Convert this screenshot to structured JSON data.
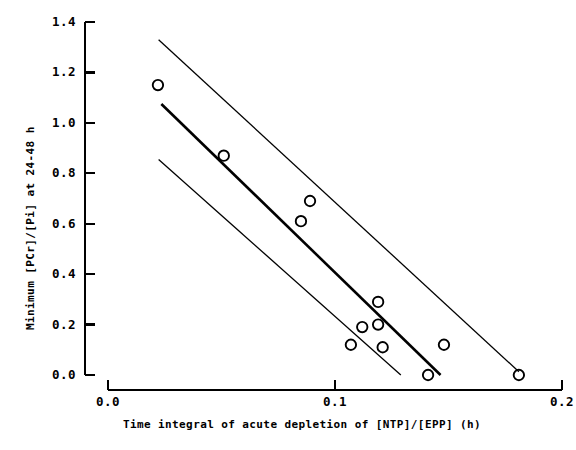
{
  "chart_data": {
    "type": "scatter",
    "title": "",
    "xlabel": "Time integral of acute depletion of [NTP]/[EPP] (h)",
    "ylabel": "Minimum [PCr]/[Pi] at 24-48 h",
    "xlim": [
      0.0,
      0.2
    ],
    "ylim": [
      0.0,
      1.4
    ],
    "xticks": [
      0.0,
      0.1,
      0.2
    ],
    "xtick_labels": [
      "0.0",
      "0.1",
      "0.2"
    ],
    "yticks": [
      0.0,
      0.2,
      0.4,
      0.6,
      0.8,
      1.0,
      1.2,
      1.4
    ],
    "ytick_labels": [
      "0.0",
      "0.2",
      "0.4",
      "0.6",
      "0.8",
      "1.0",
      "1.2",
      "1.4"
    ],
    "grid": false,
    "legend": false,
    "marker": "open-circle",
    "marker_color": "#000000",
    "points": [
      {
        "x": 0.022,
        "y": 1.15
      },
      {
        "x": 0.051,
        "y": 0.87
      },
      {
        "x": 0.089,
        "y": 0.69
      },
      {
        "x": 0.085,
        "y": 0.61
      },
      {
        "x": 0.119,
        "y": 0.29
      },
      {
        "x": 0.107,
        "y": 0.12
      },
      {
        "x": 0.112,
        "y": 0.19
      },
      {
        "x": 0.119,
        "y": 0.2
      },
      {
        "x": 0.121,
        "y": 0.11
      },
      {
        "x": 0.148,
        "y": 0.12
      },
      {
        "x": 0.141,
        "y": 0.0
      },
      {
        "x": 0.181,
        "y": 0.0
      }
    ],
    "series": [
      {
        "name": "regression-line",
        "type": "line",
        "style": "solid-thick",
        "color": "#000000",
        "x": [
          0.0235,
          0.1465
        ],
        "y": [
          1.075,
          0.0
        ]
      },
      {
        "name": "upper-confidence-band",
        "type": "line",
        "style": "solid-thin",
        "color": "#000000",
        "x": [
          0.0223,
          0.181
        ],
        "y": [
          1.33,
          0.013
        ]
      },
      {
        "name": "lower-confidence-band",
        "type": "line",
        "style": "solid-thin",
        "color": "#000000",
        "x": [
          0.0223,
          0.129
        ],
        "y": [
          0.855,
          0.0
        ]
      }
    ]
  },
  "axes": {
    "spine_color": "#000000",
    "background": "#ffffff"
  }
}
